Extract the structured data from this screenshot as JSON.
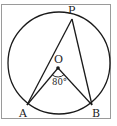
{
  "diagram": {
    "type": "circle-geometry",
    "points": {
      "P": {
        "label": "P",
        "x": 72,
        "y": 19
      },
      "O": {
        "label": "O",
        "x": 58,
        "y": 68
      },
      "A": {
        "label": "A",
        "x": 27,
        "y": 105
      },
      "B": {
        "label": "B",
        "x": 92,
        "y": 105
      }
    },
    "circle": {
      "cx": 59,
      "cy": 63,
      "r": 51
    },
    "angle_label": "80°",
    "colors": {
      "stroke": "#1a1a1a",
      "frame": "#9a9a9a",
      "background": "#ffffff"
    }
  }
}
